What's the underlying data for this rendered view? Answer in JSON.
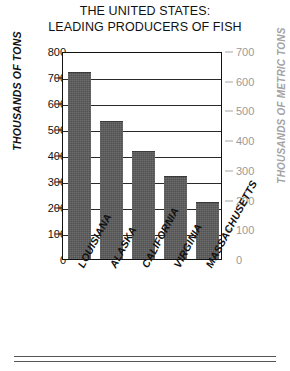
{
  "title": {
    "line1": "THE UNITED STATES:",
    "line2": "LEADING PRODUCERS OF FISH"
  },
  "chart_data": {
    "type": "bar",
    "title": "THE UNITED STATES: LEADING PRODUCERS OF FISH",
    "xlabel": "",
    "ylabel": "THOUSANDS OF TONS",
    "y2label": "THOUSANDS OF METRIC TONS",
    "categories": [
      "LOUISIANA",
      "ALASKA",
      "CALIFORNIA",
      "VIRGINIA",
      "MASSACHUSETTS"
    ],
    "values": [
      720,
      530,
      415,
      320,
      220
    ],
    "ylim": [
      0,
      800
    ],
    "yticks": [
      0,
      100,
      200,
      300,
      400,
      500,
      600,
      700,
      800
    ],
    "y2lim": [
      0,
      700
    ],
    "y2ticks": [
      0,
      100,
      200,
      300,
      400,
      500,
      600,
      700
    ],
    "grid": true,
    "legend": false,
    "bar_color": "#5b5b5b",
    "axis_color": "#111111",
    "secondary_axis_color": "#a3a3a3"
  }
}
